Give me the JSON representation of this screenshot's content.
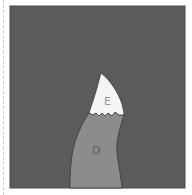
{
  "diagram": {
    "colors": {
      "background": "#5b5b5b",
      "region_e_fill": "#f4f4f4",
      "region_d_fill": "#8c8c8c",
      "outline": "#3a3a3a",
      "label_e": "#9a9a9a",
      "label_d": "#5c5c5c",
      "dashed_rule": "#c8c8c8"
    },
    "regions": [
      {
        "id": "E",
        "label": "E",
        "description": "upper white pointed region"
      },
      {
        "id": "D",
        "label": "D",
        "description": "lower gray curved region"
      }
    ]
  }
}
